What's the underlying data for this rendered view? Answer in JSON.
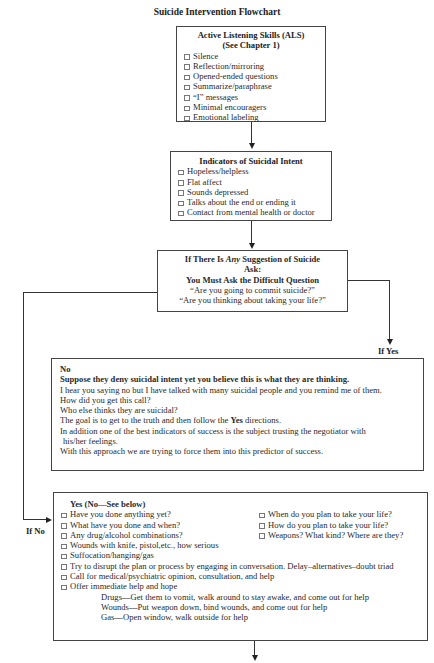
{
  "title": "Suicide Intervention Flowchart",
  "als": {
    "heading_1": "Active Listening Skills (ALS)",
    "heading_2": "(See Chapter 1)",
    "items": [
      "Silence",
      "Reflection/mirroring",
      "Opened-ended questions",
      "Summarize/paraphrase",
      "“I” messages",
      "Minimal encouragers",
      "Emotional labeling"
    ]
  },
  "indicators": {
    "heading": "Indicators of Suicidal Intent",
    "items": [
      "Hopeless/helpless",
      "Flat affect",
      "Sounds depressed",
      "Talks about the end or ending it",
      "Contact from mental health or doctor"
    ]
  },
  "question": {
    "line_1_pre": "If There Is ",
    "line_1_em": "Any",
    "line_1_post": " Suggestion of Suicide",
    "line_2": "Ask:",
    "line_3": "You Must Ask the Difficult Question",
    "line_4": "“Are you going to commit suicide?”",
    "line_5": "“Are you thinking about taking your life?”"
  },
  "labels": {
    "if_yes": "If Yes",
    "if_no": "If No"
  },
  "no_box": {
    "heading": "No",
    "subheading": "Suppose they deny suicidal intent yet you believe this is what they are thinking.",
    "lines": [
      "I hear you saying no but I have talked with many suicidal people and you remind me of them.",
      "How did you get this call?",
      "Who else thinks they are suicidal?"
    ],
    "goal_pre": "The goal is to get to the truth and then follow the ",
    "goal_bold": "Yes",
    "goal_post": " directions.",
    "line_addition_1": "In addition one of the best indicators of success is the subject trusting the negotiator with",
    "line_addition_2": "his/her feelings.",
    "line_last": "With this approach we are trying to force them into this predictor of success."
  },
  "yes_box": {
    "heading": "Yes (No—See below)",
    "left_items": [
      "Have you done anything yet?",
      "What have you done and when?",
      "Any drug/alcohol combinations?"
    ],
    "right_items": [
      "When do you plan to take your life?",
      "How do you plan to take your life?",
      "Weapons? What kind? Where are they?"
    ],
    "items": [
      "Wounds with knife, pistol,etc., how serious",
      "Suffocation/hanging/gas",
      "Try to disrupt the plan or process by engaging in conversation. Delay–alternatives–doubt triad",
      "Call for medical/psychiatric opinion, consultation, and help",
      "Offer immediate help and hope"
    ],
    "sub_items": [
      "Drugs—Get them to vomit, walk around to stay awake, and come out for help",
      "Wounds—Put weapon down, bind wounds, and come out for help",
      "Gas—Open window, walk outside for help"
    ]
  }
}
